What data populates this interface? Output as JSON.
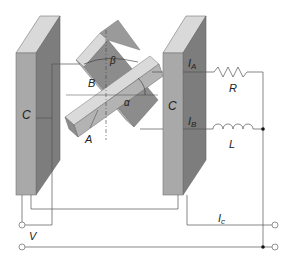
{
  "diagram": {
    "type": "piezoelectric crystal circuit schematic",
    "colors": {
      "plate_front": "#a9a9a9",
      "plate_side": "#7d7d7d",
      "plate_top": "#d9d9d9",
      "crystal_dark": "#8c8c8c",
      "crystal_mid": "#b3b3b3",
      "crystal_light": "#dadada",
      "wire": "#555555"
    },
    "labels": {
      "left_plate": "C",
      "right_plate": "C",
      "current_a": "I",
      "current_a_sub": "A",
      "current_b": "I",
      "current_b_sub": "B",
      "resistor": "R",
      "inductor": "L",
      "angle_alpha": "α",
      "angle_beta": "β",
      "crystal_b": "B",
      "crystal_a": "A",
      "voltage": "V",
      "current_c": "I",
      "current_c_sub": "c"
    }
  }
}
